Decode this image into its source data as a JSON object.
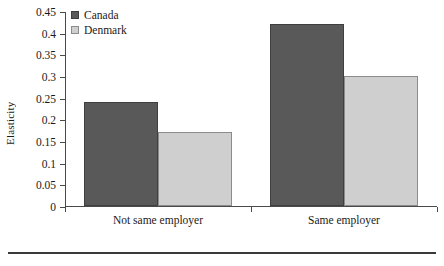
{
  "chart_data": {
    "type": "bar",
    "title": "",
    "xlabel": "",
    "ylabel": "Elasticity",
    "categories": [
      "Not same employer",
      "Same employer"
    ],
    "series": [
      {
        "name": "Canada",
        "values": [
          0.24,
          0.42
        ],
        "color": "#595959"
      },
      {
        "name": "Denmark",
        "values": [
          0.17,
          0.3
        ],
        "color": "#cfcfcf"
      }
    ],
    "ylim": [
      0,
      0.45
    ],
    "ytick_values": [
      0,
      0.05,
      0.1,
      0.15,
      0.2,
      0.25,
      0.3,
      0.35,
      0.4,
      0.45
    ],
    "ytick_labels": [
      "0",
      "0.05",
      "0.1",
      "0.15",
      "0.2",
      "0.25",
      "0.3",
      "0.35",
      "0.4",
      "0.45"
    ],
    "grid": false,
    "legend_position": "top-left"
  }
}
